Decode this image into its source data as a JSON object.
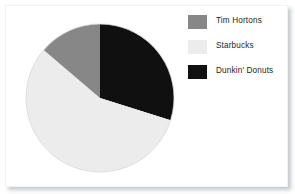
{
  "chart_data": {
    "type": "pie",
    "title": "",
    "subtitle": "",
    "xlabel": "",
    "ylabel": "",
    "grid": false,
    "legend_position": "right",
    "start_angle_deg": 0,
    "direction": "clockwise",
    "categories": [
      "Dunkin' Donuts",
      "Starbucks",
      "Tim Hortons"
    ],
    "values": [
      29.9,
      56.4,
      13.7
    ],
    "units": "percent",
    "slices": [
      {
        "label": "Dunkin' Donuts",
        "value": 29.9,
        "sweep_deg": 107.5,
        "start_deg": 0,
        "end_deg": 107.5,
        "color": "#101010"
      },
      {
        "label": "Starbucks",
        "value": 56.4,
        "sweep_deg": 203.0,
        "start_deg": 107.5,
        "end_deg": 310.5,
        "color": "#ececec"
      },
      {
        "label": "Tim Hortons",
        "value": 13.7,
        "sweep_deg": 49.5,
        "start_deg": 310.5,
        "end_deg": 360,
        "color": "#878787"
      }
    ]
  },
  "legend": {
    "items": [
      {
        "label": "Tim Hortons",
        "color": "#878787"
      },
      {
        "label": "Starbucks",
        "color": "#ececec"
      },
      {
        "label": "Dunkin' Donuts",
        "color": "#101010"
      }
    ]
  },
  "colors": {
    "tim_hortons": "#878787",
    "starbucks": "#ececec",
    "dunkin_donuts": "#101010",
    "background": "#ffffff",
    "text": "#231f20",
    "frame_shadow": "#787c80"
  }
}
